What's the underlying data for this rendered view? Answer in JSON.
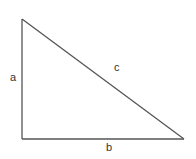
{
  "diagram": {
    "type": "right-triangle",
    "stroke_color": "#555555",
    "vertices": {
      "top": [
        22,
        19
      ],
      "bottom_left": [
        22,
        139
      ],
      "bottom_right": [
        184,
        139
      ]
    },
    "labels": {
      "side_a": "a",
      "side_b": "b",
      "side_c": "c"
    }
  }
}
